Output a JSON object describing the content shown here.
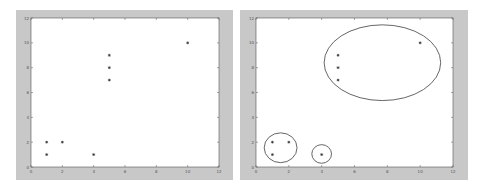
{
  "colors": {
    "figure_bg": "#c8c8c8",
    "plot_bg": "#ffffff",
    "axis": "#555555",
    "marker": "#333333",
    "ellipse": "#555555"
  },
  "chart_data": [
    {
      "type": "scatter",
      "title": "",
      "xlabel": "",
      "ylabel": "",
      "xlim": [
        0,
        12
      ],
      "ylim": [
        0,
        12
      ],
      "xticks": [
        "0",
        "2",
        "4",
        "6",
        "8",
        "10",
        "12"
      ],
      "yticks": [
        "0",
        "2",
        "4",
        "6",
        "8",
        "10",
        "12"
      ],
      "grid": false,
      "marker": "*",
      "points": [
        {
          "x": 1,
          "y": 2
        },
        {
          "x": 2,
          "y": 2
        },
        {
          "x": 1,
          "y": 1
        },
        {
          "x": 4,
          "y": 1
        },
        {
          "x": 5,
          "y": 9
        },
        {
          "x": 5,
          "y": 8
        },
        {
          "x": 5,
          "y": 7
        },
        {
          "x": 10,
          "y": 10
        }
      ]
    },
    {
      "type": "scatter",
      "title": "",
      "xlabel": "",
      "ylabel": "",
      "xlim": [
        0,
        12
      ],
      "ylim": [
        0,
        12
      ],
      "xticks": [
        "0",
        "2",
        "4",
        "6",
        "8",
        "10",
        "12"
      ],
      "yticks": [
        "0",
        "2",
        "4",
        "6",
        "8",
        "10",
        "12"
      ],
      "grid": false,
      "marker": "*",
      "points": [
        {
          "x": 1,
          "y": 2
        },
        {
          "x": 2,
          "y": 2
        },
        {
          "x": 1,
          "y": 1
        },
        {
          "x": 4,
          "y": 1
        },
        {
          "x": 5,
          "y": 9
        },
        {
          "x": 5,
          "y": 8
        },
        {
          "x": 5,
          "y": 7
        },
        {
          "x": 10,
          "y": 10
        }
      ],
      "annotations": [
        {
          "shape": "ellipse",
          "label": "cluster-1",
          "cx": 1.5,
          "cy": 1.55,
          "rx": 1.0,
          "ry": 1.2,
          "members": [
            [
              1,
              2
            ],
            [
              2,
              2
            ],
            [
              1,
              1
            ]
          ]
        },
        {
          "shape": "ellipse",
          "label": "cluster-2",
          "cx": 4.0,
          "cy": 1.05,
          "rx": 0.6,
          "ry": 0.75,
          "members": [
            [
              4,
              1
            ]
          ]
        },
        {
          "shape": "ellipse",
          "label": "cluster-3",
          "cx": 7.7,
          "cy": 8.4,
          "rx": 3.55,
          "ry": 3.05,
          "members": [
            [
              5,
              9
            ],
            [
              5,
              8
            ],
            [
              5,
              7
            ],
            [
              10,
              10
            ]
          ]
        }
      ]
    }
  ]
}
